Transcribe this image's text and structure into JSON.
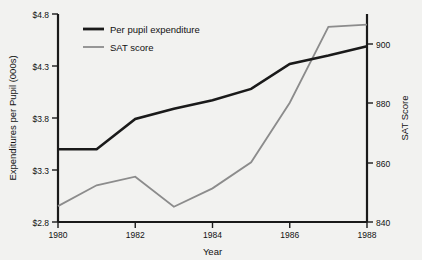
{
  "chart_data": {
    "type": "line",
    "title": "",
    "subtitle": "",
    "xlabel": "Year",
    "ylabel": "Expenditures per Pupil (000s)",
    "y2label": "SAT Score",
    "x": [
      1980,
      1981,
      1982,
      1983,
      1984,
      1985,
      1986,
      1987,
      1988
    ],
    "xtick_labels": [
      "1980",
      "1982",
      "1984",
      "1986",
      "1988"
    ],
    "xticks": [
      1980,
      1982,
      1984,
      1986,
      1988
    ],
    "xlim": [
      1980,
      1988
    ],
    "ylim": [
      2.8,
      4.8
    ],
    "yticks": [
      2.8,
      3.3,
      3.8,
      4.3,
      4.8
    ],
    "ytick_labels": [
      "$2.8",
      "$3.3",
      "$3.8",
      "$4.3",
      "$4.8"
    ],
    "y2lim": [
      840,
      908
    ],
    "y2ticks": [
      840,
      860,
      880,
      900
    ],
    "y2tick_labels": [
      "840",
      "860",
      "880",
      "900"
    ],
    "grid": false,
    "legend_position": "top-left",
    "series": [
      {
        "name": "Per pupil expenditure",
        "axis": "left",
        "color": "#1a1a1a",
        "width": "thick",
        "values": [
          3.5,
          3.5,
          3.79,
          3.89,
          3.97,
          4.08,
          4.32,
          4.4,
          4.49
        ]
      },
      {
        "name": "SAT score",
        "axis": "right",
        "color": "#8c8c8c",
        "width": "thin",
        "values": [
          845.2,
          852.0,
          854.8,
          845.0,
          851.0,
          859.5,
          879.0,
          903.8,
          904.5
        ]
      }
    ]
  },
  "legend": {
    "items": [
      {
        "label": "Per pupil expenditure"
      },
      {
        "label": "SAT score"
      }
    ]
  },
  "axes": {
    "left_title": "Expenditures per Pupil (000s)",
    "right_title": "SAT Score",
    "bottom_title": "Year"
  },
  "colors": {
    "background": "#f2f2f0",
    "axis": "#1a1a1a",
    "expenditure_line": "#1a1a1a",
    "sat_line": "#8c8c8c",
    "text": "#111111"
  }
}
